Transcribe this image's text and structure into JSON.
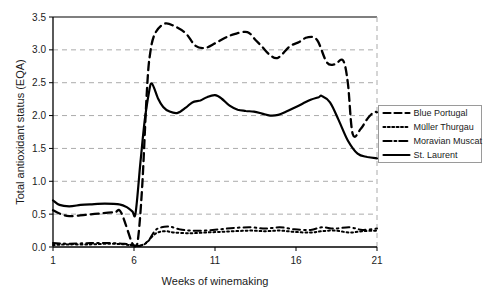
{
  "chart_data": {
    "type": "line",
    "title": "",
    "xlabel": "Weeks of winemaking",
    "ylabel": "Total antioxidant status   (EQA)",
    "xlim": [
      1,
      21
    ],
    "ylim": [
      0,
      3.5
    ],
    "x_ticks": [
      "1",
      "6",
      "11",
      "16",
      "21"
    ],
    "x_tick_values": [
      1,
      6,
      11,
      16,
      21
    ],
    "y_ticks": [
      "0.0",
      "0.5",
      "1.0",
      "1.5",
      "2.0",
      "2.5",
      "3.0",
      "3.5"
    ],
    "y_tick_values": [
      0,
      0.5,
      1.0,
      1.5,
      2.0,
      2.5,
      3.0,
      3.5
    ],
    "grid": "horizontal dashed light-gray",
    "legend_position": "right of plot, vertically centered",
    "line_color": "#000000",
    "series": [
      {
        "name": "Blue Portugal",
        "line_style": "dashed",
        "x": [
          1,
          1.4,
          2,
          3,
          3.9,
          4.8,
          5.2,
          5.9,
          6.2,
          6.5,
          6.8,
          7.0,
          7.3,
          7.9,
          8.5,
          9.2,
          9.8,
          10.4,
          11.0,
          11.6,
          12.2,
          13.0,
          13.5,
          13.9,
          14.4,
          14.9,
          15.6,
          16.2,
          16.7,
          17.3,
          17.9,
          18.4,
          18.9,
          19.2,
          19.5,
          20.0,
          20.4,
          20.8,
          21
        ],
        "y": [
          0.56,
          0.51,
          0.47,
          0.49,
          0.51,
          0.53,
          0.53,
          0.05,
          0.04,
          0.9,
          2.4,
          2.95,
          3.25,
          3.4,
          3.36,
          3.25,
          3.06,
          3.03,
          3.1,
          3.18,
          3.24,
          3.27,
          3.15,
          3.05,
          2.92,
          2.88,
          3.05,
          3.12,
          3.19,
          3.15,
          2.81,
          2.78,
          2.84,
          2.5,
          1.72,
          1.8,
          1.95,
          2.05,
          2.05
        ]
      },
      {
        "name": "Müller Thurgau",
        "line_style": "dotted",
        "x": [
          1,
          2,
          3.3,
          4.5,
          5.4,
          6.1,
          6.7,
          7.3,
          7.9,
          8.5,
          9.5,
          10.4,
          11.3,
          12.2,
          13.2,
          14.1,
          15.0,
          15.9,
          16.9,
          17.6,
          18.4,
          19.3,
          20.1,
          21
        ],
        "y": [
          0.03,
          0.04,
          0.04,
          0.05,
          0.04,
          0.02,
          0.05,
          0.2,
          0.24,
          0.22,
          0.21,
          0.22,
          0.23,
          0.24,
          0.25,
          0.24,
          0.25,
          0.23,
          0.22,
          0.24,
          0.25,
          0.22,
          0.24,
          0.25
        ]
      },
      {
        "name": "Moravian Muscat",
        "line_style": "dash-dot",
        "x": [
          1,
          2,
          3.3,
          4.5,
          5.4,
          5.9,
          6.4,
          6.9,
          7.3,
          7.7,
          8.2,
          8.8,
          9.5,
          10.4,
          11.3,
          12.2,
          13.2,
          14.1,
          15.0,
          15.9,
          16.9,
          17.6,
          18.4,
          19.3,
          20.1,
          21
        ],
        "y": [
          0.06,
          0.05,
          0.06,
          0.06,
          0.05,
          0.03,
          0.02,
          0.1,
          0.25,
          0.3,
          0.31,
          0.27,
          0.25,
          0.25,
          0.27,
          0.29,
          0.3,
          0.28,
          0.3,
          0.27,
          0.26,
          0.3,
          0.28,
          0.3,
          0.26,
          0.28
        ]
      },
      {
        "name": "St. Laurent",
        "line_style": "solid",
        "x": [
          1,
          1.4,
          2,
          2.7,
          3.3,
          4.2,
          5.1,
          5.6,
          5.9,
          6.1,
          6.4,
          6.65,
          6.9,
          7.1,
          7.5,
          7.8,
          8.2,
          8.7,
          9.2,
          9.6,
          10.1,
          10.5,
          11.0,
          11.4,
          11.9,
          12.4,
          12.9,
          13.4,
          13.9,
          14.4,
          14.9,
          15.4,
          15.9,
          16.4,
          16.9,
          17.4,
          17.6,
          18.1,
          18.6,
          19.2,
          19.8,
          20.4,
          21
        ],
        "y": [
          0.71,
          0.64,
          0.62,
          0.64,
          0.65,
          0.66,
          0.65,
          0.6,
          0.54,
          0.52,
          1.3,
          1.9,
          2.32,
          2.49,
          2.25,
          2.13,
          2.06,
          2.04,
          2.12,
          2.2,
          2.23,
          2.28,
          2.31,
          2.26,
          2.15,
          2.09,
          2.07,
          2.06,
          2.03,
          2.0,
          2.01,
          2.06,
          2.12,
          2.18,
          2.24,
          2.28,
          2.3,
          2.2,
          1.95,
          1.62,
          1.42,
          1.37,
          1.35
        ]
      }
    ]
  },
  "legend": {
    "items": [
      "Blue Portugal",
      "Müller Thurgau",
      "Moravian Muscat",
      "St. Laurent"
    ]
  },
  "colors": {
    "line": "#000000",
    "grid": "#ababab",
    "axis": "#000000",
    "legend_border": "#9a9a9a",
    "background": "#ffffff"
  }
}
